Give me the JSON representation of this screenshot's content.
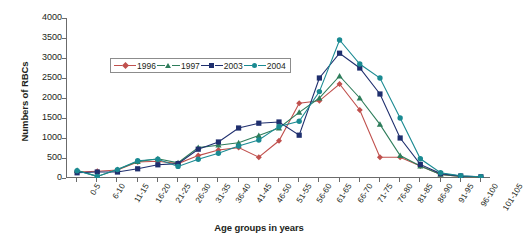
{
  "chart_data": {
    "type": "line",
    "title": "",
    "xlabel": "Age groups in years",
    "ylabel": "Numbers of RBCs",
    "ylim": [
      0,
      4000
    ],
    "ytick_step": 500,
    "yticks": [
      0,
      500,
      1000,
      1500,
      2000,
      2500,
      3000,
      3500,
      4000
    ],
    "grid": false,
    "legend_position": "upper-left-inside",
    "categories": [
      "0-5",
      "6-10",
      "11-15",
      "16-20",
      "21-25",
      "26-30",
      "31-35",
      "36-40",
      "41-45",
      "46-50",
      "51-55",
      "56-60",
      "61-65",
      "66-70",
      "71-75",
      "76-80",
      "81-85",
      "86-90",
      "91-95",
      "96-100",
      "101-105"
    ],
    "series": [
      {
        "name": "1996",
        "color": "#c0504d",
        "marker": "diamond",
        "values": [
          150,
          170,
          200,
          400,
          420,
          360,
          560,
          700,
          760,
          520,
          930,
          1870,
          1930,
          2350,
          1700,
          520,
          520,
          300,
          90,
          40,
          25
        ]
      },
      {
        "name": "1997",
        "color": "#2e7d5b",
        "marker": "triangle",
        "values": [
          190,
          40,
          210,
          410,
          480,
          380,
          760,
          820,
          880,
          1060,
          1250,
          1640,
          2000,
          2550,
          2000,
          1340,
          560,
          300,
          90,
          40,
          25
        ]
      },
      {
        "name": "2003",
        "color": "#1f2f6e",
        "marker": "square",
        "values": [
          130,
          150,
          150,
          230,
          330,
          360,
          720,
          900,
          1250,
          1370,
          1400,
          1070,
          2500,
          3120,
          2750,
          2100,
          1000,
          340,
          110,
          50,
          30
        ]
      },
      {
        "name": "2004",
        "color": "#1a8a92",
        "marker": "circle",
        "values": [
          180,
          40,
          210,
          430,
          470,
          290,
          470,
          620,
          800,
          950,
          1290,
          1420,
          2160,
          3450,
          2850,
          2500,
          1500,
          480,
          130,
          55,
          30
        ]
      }
    ]
  },
  "legend": {
    "entries": [
      {
        "label": "1996"
      },
      {
        "label": "1997"
      },
      {
        "label": "2003"
      },
      {
        "label": "2004"
      }
    ]
  }
}
